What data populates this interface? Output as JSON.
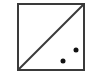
{
  "icon": {
    "name": "split-square-with-dots",
    "stroke_color": "#3a3a3a",
    "fill_color": "#ffffff",
    "dot_color": "#111111",
    "box": {
      "x": 18,
      "y": 4,
      "width": 66,
      "height": 66
    },
    "diagonal": {
      "x1": 18,
      "y1": 70,
      "x2": 84,
      "y2": 4
    },
    "dots": [
      {
        "cx": 76,
        "cy": 50,
        "r": 2.5
      },
      {
        "cx": 63,
        "cy": 61,
        "r": 2.5
      }
    ]
  }
}
